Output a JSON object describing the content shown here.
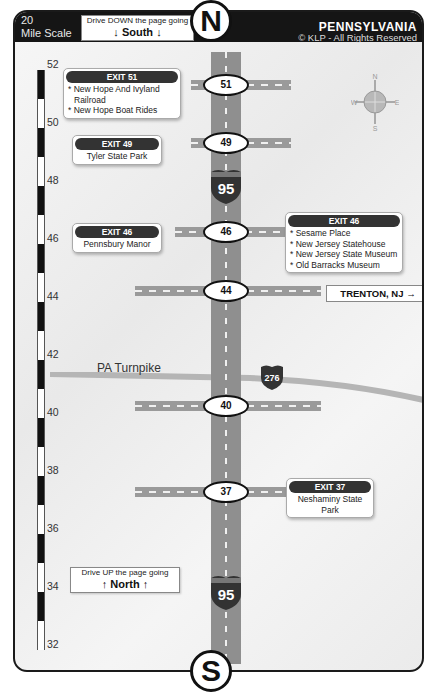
{
  "header": {
    "scale_line1": "20",
    "scale_line2": "Mile Scale",
    "drive_south_small": "Drive DOWN the page going",
    "drive_south_big": "↓ South ↓",
    "state": "PENNSYLVANIA",
    "copyright": "© KLP - All Rights Reserved"
  },
  "compass": {
    "n": "N",
    "s": "S",
    "e": "E",
    "w": "W"
  },
  "highway": {
    "name": "I-95",
    "shield_number": "95",
    "north_marker": "N",
    "south_marker": "S"
  },
  "mile_scale": [
    "52",
    "50",
    "48",
    "46",
    "44",
    "42",
    "40",
    "38",
    "36",
    "34",
    "32"
  ],
  "exits": [
    {
      "number": "51",
      "callouts": [
        {
          "title": "EXIT 51",
          "lines": [
            "* New Hope And Ivyland",
            "  Railroad",
            "* New Hope Boat Rides"
          ]
        }
      ]
    },
    {
      "number": "49",
      "callouts": [
        {
          "title": "EXIT 49",
          "lines": [
            "Tyler State Park"
          ]
        }
      ]
    },
    {
      "number": "46",
      "callouts": [
        {
          "title": "EXIT 46",
          "lines": [
            "Pennsbury Manor"
          ]
        },
        {
          "title": "EXIT 46",
          "lines": [
            "* Sesame Place",
            "* New Jersey Statehouse",
            "* New Jersey State Museum",
            "* Old Barracks Museum"
          ]
        }
      ]
    },
    {
      "number": "44",
      "callouts": []
    },
    {
      "number": "40",
      "callouts": []
    },
    {
      "number": "37",
      "callouts": [
        {
          "title": "EXIT 37",
          "lines": [
            "Neshaminy State",
            "Park"
          ]
        }
      ]
    }
  ],
  "turnpike": {
    "label": "PA Turnpike",
    "shield_number": "276"
  },
  "trenton_sign": "TRENTON, NJ →",
  "drive_north": {
    "small": "Drive UP the page going",
    "big": "↑ North ↑"
  },
  "colors": {
    "header_bg": "#151515",
    "road": "#8f8f8f",
    "shield_red": "#333333",
    "turnpike": "#b5b5b5"
  }
}
